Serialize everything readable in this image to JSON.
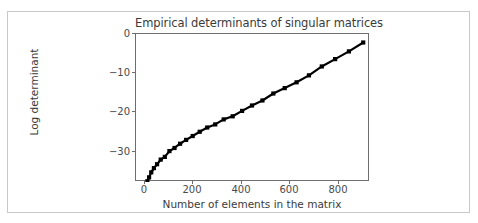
{
  "figure": {
    "background_color": "#ffffff",
    "frame_color": "#c9c9c9",
    "axes_color": "#6e6e6e",
    "text_color": "#3b3b3b",
    "line_color": "#000000",
    "marker_color": "#000000"
  },
  "chart_data": {
    "type": "line",
    "title": "Empirical determinants of singular matrices",
    "xlabel": "Number of elements in the matrix",
    "ylabel": "Log determinant",
    "xlim": [
      -38,
      928
    ],
    "ylim": [
      -37.2,
      1.1
    ],
    "xticks": [
      0,
      200,
      400,
      600,
      800
    ],
    "xtick_labels": [
      "0",
      "200",
      "400",
      "600",
      "800"
    ],
    "yticks": [
      0,
      -10,
      -20,
      -30
    ],
    "ytick_labels": [
      "0",
      "−10",
      "−20",
      "−30"
    ],
    "grid": false,
    "legend": null,
    "marker": "square",
    "series": [
      {
        "name": "log determinant",
        "x": [
          9,
          16,
          25,
          36,
          49,
          64,
          81,
          100,
          121,
          144,
          169,
          196,
          225,
          256,
          289,
          324,
          361,
          400,
          441,
          484,
          529,
          576,
          625,
          676,
          729,
          784,
          841,
          900
        ],
        "values": [
          -37.0,
          -36.0,
          -34.7,
          -33.6,
          -32.6,
          -31.4,
          -30.7,
          -29.2,
          -28.4,
          -27.3,
          -26.3,
          -25.3,
          -24.2,
          -23.1,
          -22.3,
          -21.0,
          -20.2,
          -18.8,
          -17.4,
          -16.1,
          -14.3,
          -12.9,
          -11.4,
          -9.6,
          -7.3,
          -5.4,
          -3.4,
          -1.1
        ]
      }
    ]
  }
}
